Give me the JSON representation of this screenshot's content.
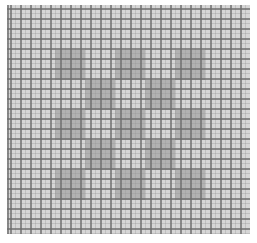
{
  "pattern": {
    "description": "checkerboard-over-grid",
    "grid": {
      "columns": 24,
      "rows": 23,
      "cell_px": 10
    },
    "colors": {
      "background": "#ffffff",
      "cell_light": "#d6d6d6",
      "block_dark": "#b2b2b2",
      "grid_line": "#6e6e6e"
    },
    "checkerboard": {
      "rows": 5,
      "cols": 5,
      "block_px": 30,
      "origin": {
        "x": 48,
        "y": 45
      },
      "dark_cells": [
        [
          0,
          0
        ],
        [
          0,
          2
        ],
        [
          0,
          4
        ],
        [
          1,
          1
        ],
        [
          1,
          3
        ],
        [
          2,
          0
        ],
        [
          2,
          2
        ],
        [
          2,
          4
        ],
        [
          3,
          1
        ],
        [
          3,
          3
        ],
        [
          4,
          0
        ],
        [
          4,
          2
        ],
        [
          4,
          4
        ]
      ]
    }
  }
}
